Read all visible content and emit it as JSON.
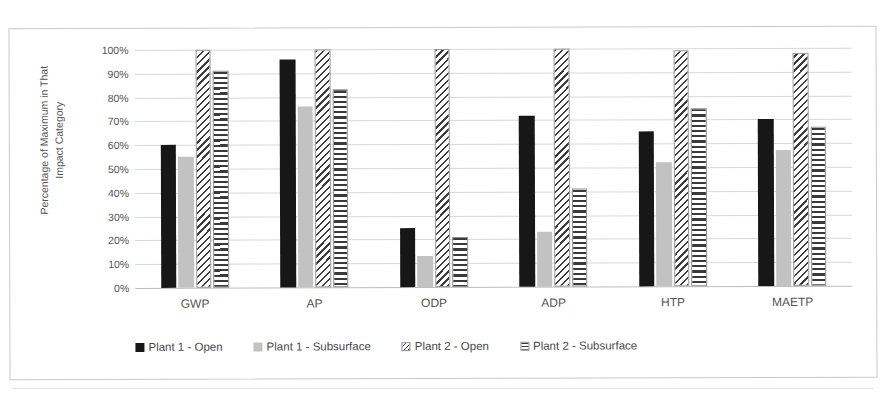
{
  "figure": {
    "top_text_fragment": "",
    "frame_border_color": "#c9c9c9"
  },
  "chart_data": {
    "type": "bar",
    "title": "",
    "xlabel": "",
    "ylabel": "Percentage of Maximum in That\nImpact Category",
    "categories": [
      "GWP",
      "AP",
      "ODP",
      "ADP",
      "HTP",
      "MAETP"
    ],
    "ylim": [
      0,
      100
    ],
    "ytick_labels": [
      "0%",
      "10%",
      "20%",
      "30%",
      "40%",
      "50%",
      "60%",
      "70%",
      "80%",
      "90%",
      "100%"
    ],
    "ytick_values": [
      0,
      10,
      20,
      30,
      40,
      50,
      60,
      70,
      80,
      90,
      100
    ],
    "grid": true,
    "legend_position": "bottom",
    "series": [
      {
        "name": "Plant 1 - Open",
        "color": "#171717",
        "pattern": "solid-black",
        "values": [
          60,
          96,
          25,
          72,
          65,
          70
        ]
      },
      {
        "name": "Plant 1 - Subsurface",
        "color": "#c2c2c2",
        "pattern": "solid-light-gray",
        "values": [
          55,
          76,
          13,
          23,
          52,
          57
        ]
      },
      {
        "name": "Plant 2 - Open",
        "color": "#3d3d3d",
        "pattern": "diagonal-hatch",
        "values": [
          100,
          100,
          100,
          100,
          99,
          98
        ]
      },
      {
        "name": "Plant 2 - Subsurface",
        "color": "#3a3a3a",
        "pattern": "horizontal-hatch",
        "values": [
          91,
          83,
          21,
          41,
          75,
          67
        ]
      }
    ]
  }
}
